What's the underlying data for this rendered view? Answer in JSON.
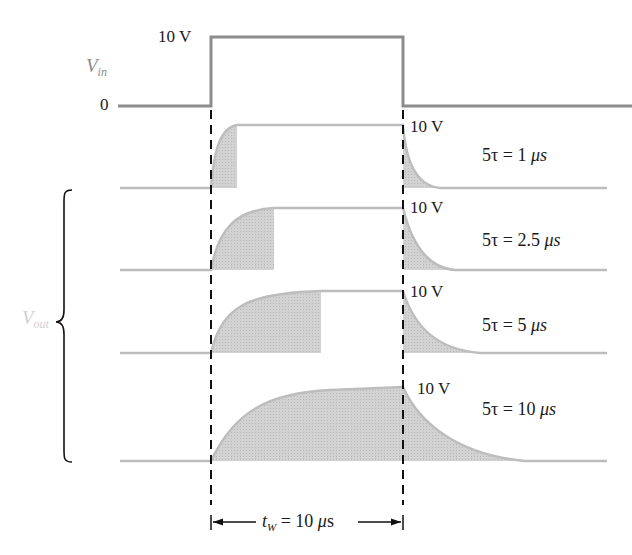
{
  "diagram": {
    "colors": {
      "waveform": "#8c8c8c",
      "output_line": "#bdbdbd",
      "fill": "#cfcfcf",
      "dashes": "#111111",
      "vin_label": "#8a8a8a",
      "vout_label": "#d0d0d0"
    },
    "input": {
      "label_main": "V",
      "label_sub": "in",
      "high_label": "10 V",
      "low_label": "0"
    },
    "output": {
      "label_main": "V",
      "label_sub": "out",
      "rows": [
        {
          "level_label": "10 V",
          "tau_prefix": "5τ = ",
          "tau_value": "1",
          "tau_unit": " μs"
        },
        {
          "level_label": "10 V",
          "tau_prefix": "5τ = ",
          "tau_value": "2.5",
          "tau_unit": " μs"
        },
        {
          "level_label": "10 V",
          "tau_prefix": "5τ = ",
          "tau_value": "5",
          "tau_unit": " μs"
        },
        {
          "level_label": "10 V",
          "tau_prefix": "5τ = ",
          "tau_value": "10",
          "tau_unit": " μs"
        }
      ]
    },
    "pulse_width": {
      "label_main": "t",
      "label_sub": "W",
      "label_rest": " = 10 ",
      "label_unit_mu": "μ",
      "label_unit_s": "s"
    }
  }
}
